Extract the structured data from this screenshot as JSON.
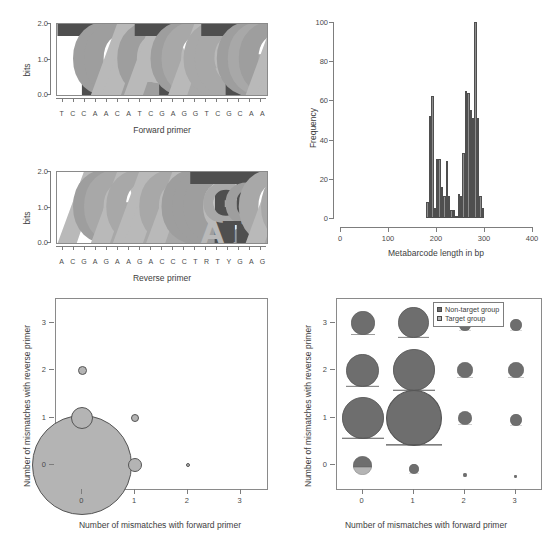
{
  "figure": {
    "panels": [
      "forward-primer-logo",
      "reverse-primer-logo",
      "metabarcode-length-histogram",
      "mismatch-bubble-target",
      "mismatch-bubble-groups"
    ]
  },
  "chart_data": [
    {
      "type": "bar",
      "id": "forward-primer-logo",
      "title": "Forward primer",
      "xlabel": "",
      "ylabel": "bits",
      "ylim": [
        0,
        2.0
      ],
      "yticks": [
        "0.0",
        "1.0",
        "2.0"
      ],
      "sequence": "TCCAACATCGAGGTCGCAA",
      "categories": [
        "T",
        "C",
        "C",
        "A",
        "A",
        "C",
        "A",
        "T",
        "C",
        "G",
        "A",
        "G",
        "G",
        "T",
        "C",
        "G",
        "C",
        "A",
        "A"
      ],
      "values": [
        2.0,
        2.0,
        2.0,
        2.0,
        2.0,
        2.0,
        2.0,
        2.0,
        2.0,
        2.0,
        2.0,
        2.0,
        2.0,
        2.0,
        2.0,
        2.0,
        2.0,
        2.0,
        2.0
      ],
      "stacks": [
        [
          {
            "letter": "T",
            "bits": 2.0
          }
        ],
        [
          {
            "letter": "C",
            "bits": 2.0
          }
        ],
        [
          {
            "letter": "C",
            "bits": 2.0
          }
        ],
        [
          {
            "letter": "A",
            "bits": 2.0
          }
        ],
        [
          {
            "letter": "A",
            "bits": 2.0
          }
        ],
        [
          {
            "letter": "C",
            "bits": 2.0
          }
        ],
        [
          {
            "letter": "A",
            "bits": 2.0
          }
        ],
        [
          {
            "letter": "T",
            "bits": 2.0
          }
        ],
        [
          {
            "letter": "C",
            "bits": 2.0
          }
        ],
        [
          {
            "letter": "G",
            "bits": 2.0
          }
        ],
        [
          {
            "letter": "A",
            "bits": 2.0
          }
        ],
        [
          {
            "letter": "G",
            "bits": 2.0
          }
        ],
        [
          {
            "letter": "G",
            "bits": 2.0
          }
        ],
        [
          {
            "letter": "T",
            "bits": 2.0
          }
        ],
        [
          {
            "letter": "C",
            "bits": 2.0
          }
        ],
        [
          {
            "letter": "G",
            "bits": 2.0
          }
        ],
        [
          {
            "letter": "C",
            "bits": 2.0
          }
        ],
        [
          {
            "letter": "A",
            "bits": 2.0
          }
        ],
        [
          {
            "letter": "A",
            "bits": 2.0
          }
        ]
      ]
    },
    {
      "type": "bar",
      "id": "reverse-primer-logo",
      "title": "Reverse primer",
      "xlabel": "",
      "ylabel": "bits",
      "ylim": [
        0,
        2.0
      ],
      "yticks": [
        "0.0",
        "1.0",
        "2.0"
      ],
      "sequence": "ACGAGAAGACCCTRTYGAG",
      "categories": [
        "A",
        "C",
        "G",
        "A",
        "G",
        "A",
        "A",
        "G",
        "A",
        "C",
        "C",
        "C",
        "T",
        "R",
        "T",
        "Y",
        "G",
        "A",
        "G"
      ],
      "values": [
        2.0,
        2.0,
        2.0,
        2.0,
        2.0,
        2.0,
        2.0,
        2.0,
        2.0,
        2.0,
        2.0,
        2.0,
        2.0,
        1.75,
        2.0,
        1.75,
        2.0,
        2.0,
        2.0
      ],
      "stacks": [
        [
          {
            "letter": "A",
            "bits": 2.0
          }
        ],
        [
          {
            "letter": "C",
            "bits": 2.0
          }
        ],
        [
          {
            "letter": "G",
            "bits": 2.0
          }
        ],
        [
          {
            "letter": "A",
            "bits": 2.0
          }
        ],
        [
          {
            "letter": "G",
            "bits": 2.0
          }
        ],
        [
          {
            "letter": "A",
            "bits": 2.0
          }
        ],
        [
          {
            "letter": "A",
            "bits": 2.0
          }
        ],
        [
          {
            "letter": "G",
            "bits": 2.0
          }
        ],
        [
          {
            "letter": "A",
            "bits": 2.0
          }
        ],
        [
          {
            "letter": "C",
            "bits": 2.0
          }
        ],
        [
          {
            "letter": "C",
            "bits": 2.0
          }
        ],
        [
          {
            "letter": "C",
            "bits": 2.0
          }
        ],
        [
          {
            "letter": "T",
            "bits": 2.0
          }
        ],
        [
          {
            "letter": "G",
            "bits": 1.05
          },
          {
            "letter": "A",
            "bits": 0.6
          }
        ],
        [
          {
            "letter": "T",
            "bits": 2.0
          }
        ],
        [
          {
            "letter": "C",
            "bits": 1.1
          },
          {
            "letter": "T",
            "bits": 0.55
          }
        ],
        [
          {
            "letter": "G",
            "bits": 2.0
          }
        ],
        [
          {
            "letter": "A",
            "bits": 2.0
          }
        ],
        [
          {
            "letter": "G",
            "bits": 2.0
          }
        ]
      ]
    },
    {
      "type": "bar",
      "id": "metabarcode-length-histogram",
      "title": "",
      "xlabel": "Metabarcode length in bp",
      "ylabel": "Frequency",
      "xlim": [
        0,
        400
      ],
      "ylim": [
        0,
        100
      ],
      "xticks": [
        "0",
        "100",
        "200",
        "300",
        "400"
      ],
      "yticks": [
        "0",
        "20",
        "40",
        "60",
        "80",
        "100"
      ],
      "bin_width": 5,
      "bins": [
        {
          "start": 180,
          "value": 8
        },
        {
          "start": 185,
          "value": 52
        },
        {
          "start": 190,
          "value": 62
        },
        {
          "start": 195,
          "value": 5
        },
        {
          "start": 200,
          "value": 30
        },
        {
          "start": 205,
          "value": 30
        },
        {
          "start": 210,
          "value": 16
        },
        {
          "start": 215,
          "value": 11
        },
        {
          "start": 220,
          "value": 29
        },
        {
          "start": 225,
          "value": 11
        },
        {
          "start": 230,
          "value": 4
        },
        {
          "start": 235,
          "value": 4
        },
        {
          "start": 240,
          "value": 1
        },
        {
          "start": 245,
          "value": 12
        },
        {
          "start": 250,
          "value": 11
        },
        {
          "start": 255,
          "value": 33
        },
        {
          "start": 260,
          "value": 65
        },
        {
          "start": 265,
          "value": 64
        },
        {
          "start": 270,
          "value": 55
        },
        {
          "start": 275,
          "value": 51
        },
        {
          "start": 280,
          "value": 100
        },
        {
          "start": 285,
          "value": 51
        },
        {
          "start": 290,
          "value": 11
        },
        {
          "start": 295,
          "value": 5
        }
      ]
    },
    {
      "type": "scatter",
      "id": "mismatch-bubble-target",
      "title": "",
      "xlabel": "Number of mismatches with forward primer",
      "ylabel": "Number of mismatches with reverse primer",
      "xlim": [
        -0.5,
        3.5
      ],
      "ylim": [
        -0.5,
        3.5
      ],
      "xticks": [
        "0",
        "1",
        "2",
        "3"
      ],
      "yticks": [
        "0",
        "1",
        "2",
        "3"
      ],
      "points": [
        {
          "x": 0,
          "y": 0,
          "size": 100
        },
        {
          "x": 0,
          "y": 1,
          "size": 22
        },
        {
          "x": 0,
          "y": 2,
          "size": 9
        },
        {
          "x": 1,
          "y": 0,
          "size": 14
        },
        {
          "x": 1,
          "y": 1,
          "size": 8
        },
        {
          "x": 2,
          "y": 0,
          "size": 4
        }
      ]
    },
    {
      "type": "scatter",
      "id": "mismatch-bubble-groups",
      "title": "",
      "xlabel": "Number of mismatches with forward primer",
      "ylabel": "Number of mismatches with reverse primer",
      "xlim": [
        -0.5,
        3.5
      ],
      "ylim": [
        -0.5,
        3.5
      ],
      "xticks": [
        "0",
        "1",
        "2",
        "3"
      ],
      "yticks": [
        "0",
        "1",
        "2",
        "3"
      ],
      "legend": {
        "position": "top-right",
        "entries": [
          {
            "label": "Non-target group",
            "color": "#6e6e6e"
          },
          {
            "label": "Target group",
            "color": "#b4b4b4"
          }
        ]
      },
      "points": [
        {
          "x": 0,
          "y": 0,
          "size": 19,
          "target_fraction": 0.42
        },
        {
          "x": 0,
          "y": 1,
          "size": 42,
          "target_fraction": 0.02
        },
        {
          "x": 0,
          "y": 2,
          "size": 33,
          "target_fraction": 0.02
        },
        {
          "x": 0,
          "y": 3,
          "size": 24,
          "target_fraction": 0.02
        },
        {
          "x": 1,
          "y": 0,
          "size": 10,
          "target_fraction": 0.02
        },
        {
          "x": 1,
          "y": 1,
          "size": 56,
          "target_fraction": 0.02
        },
        {
          "x": 1,
          "y": 2,
          "size": 42,
          "target_fraction": 0.02
        },
        {
          "x": 1,
          "y": 3,
          "size": 31,
          "target_fraction": 0.02
        },
        {
          "x": 2,
          "y": 0,
          "size": 4,
          "target_fraction": 0.02
        },
        {
          "x": 2,
          "y": 1,
          "size": 14,
          "target_fraction": 0.02
        },
        {
          "x": 2,
          "y": 2,
          "size": 16,
          "target_fraction": 0.02
        },
        {
          "x": 2,
          "y": 3,
          "size": 12,
          "target_fraction": 0.02
        },
        {
          "x": 3,
          "y": 0,
          "size": 3,
          "target_fraction": 0.02
        },
        {
          "x": 3,
          "y": 1,
          "size": 12,
          "target_fraction": 0.02
        },
        {
          "x": 3,
          "y": 2,
          "size": 16,
          "target_fraction": 0.02
        },
        {
          "x": 3,
          "y": 3,
          "size": 12,
          "target_fraction": 0.02
        }
      ]
    }
  ],
  "colors": {
    "nucleotide_A": "#b9b9b9",
    "nucleotide_C": "#9e9e9e",
    "nucleotide_G": "#a8a8a8",
    "nucleotide_T": "#4f4f4f",
    "bar_fill": "#8d8d8d",
    "bar_stroke": "#4f4f4f",
    "bubble_target": "#b4b4b4",
    "bubble_nontarget": "#6e6e6e",
    "bubble_stroke": "#555555",
    "axis": "#7d7d7d"
  }
}
